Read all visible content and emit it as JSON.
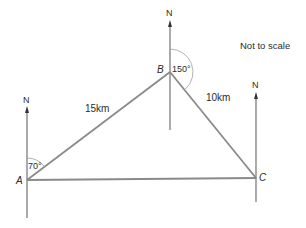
{
  "diagram": {
    "note": "Not to scale",
    "north_label": "N",
    "points": {
      "A": {
        "label": "A",
        "x": 27,
        "y": 180
      },
      "B": {
        "label": "B",
        "x": 170,
        "y": 72
      },
      "C": {
        "label": "C",
        "x": 256,
        "y": 178
      }
    },
    "edges": [
      {
        "from": "A",
        "to": "B",
        "length": "15km"
      },
      {
        "from": "B",
        "to": "C",
        "length": "10km"
      },
      {
        "from": "A",
        "to": "C",
        "length": ""
      }
    ],
    "angles": {
      "A": "70°",
      "B": "150°"
    },
    "colors": {
      "line": "#8a8a8a",
      "arrow": "#3a3a3a",
      "text": "#2b2b2b"
    }
  }
}
